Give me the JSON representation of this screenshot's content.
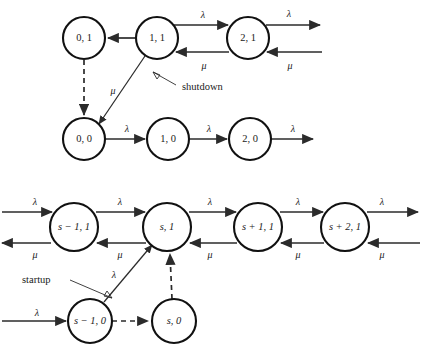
{
  "figure": {
    "type": "state-transition-diagram",
    "title": "",
    "background_color": "#ffffff",
    "stroke_color": "#2b2b2b",
    "node_fill": "#ffffff"
  },
  "symbols": {
    "lambda": "λ",
    "mu": "μ",
    "minus": "−",
    "plus": "+"
  },
  "annotations": [
    {
      "id": "shutdown",
      "text": "shutdown"
    },
    {
      "id": "startup",
      "text": "startup"
    }
  ],
  "caption": {
    "text": ""
  },
  "upper_chain": {
    "name": "upper-chain",
    "nodes": [
      {
        "id": "n-0-1",
        "label": "0, 1",
        "italic": false,
        "cx": 84,
        "cy": 38,
        "r": 21
      },
      {
        "id": "n-1-1",
        "label": "1, 1",
        "italic": false,
        "cx": 157,
        "cy": 38,
        "r": 21
      },
      {
        "id": "n-2-1",
        "label": "2, 1",
        "italic": false,
        "cx": 248,
        "cy": 38,
        "r": 21
      },
      {
        "id": "n-0-0",
        "label": "0, 0",
        "italic": false,
        "cx": 84,
        "cy": 139,
        "r": 21
      },
      {
        "id": "n-1-0",
        "label": "1, 0",
        "italic": false,
        "cx": 168,
        "cy": 139,
        "r": 21
      },
      {
        "id": "n-2-0",
        "label": "2, 0",
        "italic": false,
        "cx": 250,
        "cy": 139,
        "r": 21
      }
    ],
    "edges": [
      {
        "id": "e-11-to-01",
        "from": "n-1-1",
        "to": "n-0-1",
        "rate": "μ",
        "style": "solid",
        "rate_shown": false
      },
      {
        "id": "e-11-to-21",
        "from": "n-1-1",
        "to": "n-2-1",
        "rate": "λ",
        "style": "solid",
        "rate_shown": true
      },
      {
        "id": "e-21-to-11",
        "from": "n-2-1",
        "to": "n-1-1",
        "rate": "μ",
        "style": "solid",
        "rate_shown": true
      },
      {
        "id": "e-21-out",
        "from": "n-2-1",
        "to": "offpage",
        "rate": "λ",
        "style": "solid",
        "rate_shown": true
      },
      {
        "id": "e-in-to-21",
        "from": "offpage",
        "to": "n-2-1",
        "rate": "μ",
        "style": "solid",
        "rate_shown": true
      },
      {
        "id": "e-01-to-00",
        "from": "n-0-1",
        "to": "n-0-0",
        "rate": "",
        "style": "dashed",
        "rate_shown": false
      },
      {
        "id": "e-11-to-00",
        "from": "n-1-1",
        "to": "n-0-0",
        "rate": "μ",
        "style": "solid",
        "rate_shown": true
      },
      {
        "id": "e-00-to-10",
        "from": "n-0-0",
        "to": "n-1-0",
        "rate": "λ",
        "style": "solid",
        "rate_shown": true
      },
      {
        "id": "e-10-to-20",
        "from": "n-1-0",
        "to": "n-2-0",
        "rate": "λ",
        "style": "solid",
        "rate_shown": true
      },
      {
        "id": "e-20-out",
        "from": "n-2-0",
        "to": "offpage",
        "rate": "λ",
        "style": "solid",
        "rate_shown": true
      }
    ]
  },
  "lower_chain": {
    "name": "lower-chain",
    "nodes": [
      {
        "id": "n-sm1-1",
        "label": "s − 1, 1",
        "italic": true,
        "cx": 74,
        "cy": 227,
        "r": 24
      },
      {
        "id": "n-s-1",
        "label": "s, 1",
        "italic": true,
        "cx": 167,
        "cy": 227,
        "r": 24
      },
      {
        "id": "n-sp1-1",
        "label": "s + 1, 1",
        "italic": true,
        "cx": 258,
        "cy": 227,
        "r": 24
      },
      {
        "id": "n-sp2-1",
        "label": "s + 2, 1",
        "italic": true,
        "cx": 345,
        "cy": 227,
        "r": 24
      },
      {
        "id": "n-sm1-0",
        "label": "s − 1, 0",
        "italic": true,
        "cx": 90,
        "cy": 321,
        "r": 22
      },
      {
        "id": "n-s-0",
        "label": "s, 0",
        "italic": true,
        "cx": 174,
        "cy": 321,
        "r": 22
      }
    ],
    "edges": [
      {
        "id": "l-in-to-sm11",
        "from": "offpage",
        "to": "n-sm1-1",
        "rate": "λ",
        "style": "solid",
        "rate_shown": true
      },
      {
        "id": "l-sm11-out",
        "from": "n-sm1-1",
        "to": "offpage",
        "rate": "μ",
        "style": "solid",
        "rate_shown": true
      },
      {
        "id": "l-sm11-to-s1",
        "from": "n-sm1-1",
        "to": "n-s-1",
        "rate": "λ",
        "style": "solid",
        "rate_shown": true
      },
      {
        "id": "l-s1-to-sm11",
        "from": "n-s-1",
        "to": "n-sm1-1",
        "rate": "μ",
        "style": "solid",
        "rate_shown": true
      },
      {
        "id": "l-s1-to-sp11",
        "from": "n-s-1",
        "to": "n-sp1-1",
        "rate": "λ",
        "style": "solid",
        "rate_shown": true
      },
      {
        "id": "l-sp11-to-s1",
        "from": "n-sp1-1",
        "to": "n-s-1",
        "rate": "μ",
        "style": "solid",
        "rate_shown": true
      },
      {
        "id": "l-sp11-to-sp21",
        "from": "n-sp1-1",
        "to": "n-sp2-1",
        "rate": "λ",
        "style": "solid",
        "rate_shown": true
      },
      {
        "id": "l-sp21-to-sp11",
        "from": "n-sp2-1",
        "to": "n-sp1-1",
        "rate": "μ",
        "style": "solid",
        "rate_shown": true
      },
      {
        "id": "l-sp21-out",
        "from": "n-sp2-1",
        "to": "offpage",
        "rate": "λ",
        "style": "solid",
        "rate_shown": true
      },
      {
        "id": "l-in-to-sp21",
        "from": "offpage",
        "to": "n-sp2-1",
        "rate": "μ",
        "style": "solid",
        "rate_shown": true
      },
      {
        "id": "l-in-to-sm10",
        "from": "offpage",
        "to": "n-sm1-0",
        "rate": "λ",
        "style": "solid",
        "rate_shown": true
      },
      {
        "id": "l-sm10-to-s1",
        "from": "n-sm1-0",
        "to": "n-s-1",
        "rate": "λ",
        "style": "solid",
        "rate_shown": true
      },
      {
        "id": "l-sm10-to-s0",
        "from": "n-sm1-0",
        "to": "n-s-0",
        "rate": "",
        "style": "dashed",
        "rate_shown": false
      },
      {
        "id": "l-s0-to-s1",
        "from": "n-s-0",
        "to": "n-s-1",
        "rate": "",
        "style": "dashed",
        "rate_shown": false
      }
    ]
  },
  "rate_labels": {
    "upper": [
      {
        "id": "u-lam-1",
        "text": "λ",
        "x": 203,
        "y": 14
      },
      {
        "id": "u-lam-2",
        "text": "λ",
        "x": 289,
        "y": 13
      },
      {
        "id": "u-mu-1",
        "text": "μ",
        "x": 204,
        "y": 66
      },
      {
        "id": "u-mu-2",
        "text": "μ",
        "x": 290,
        "y": 66
      },
      {
        "id": "u-mu-3",
        "text": "μ",
        "x": 113,
        "y": 91
      },
      {
        "id": "u-lam-3",
        "text": "λ",
        "x": 127,
        "y": 129
      },
      {
        "id": "u-lam-4",
        "text": "λ",
        "x": 209,
        "y": 129
      },
      {
        "id": "u-lam-5",
        "text": "λ",
        "x": 293,
        "y": 129
      }
    ],
    "lower": [
      {
        "id": "l-lam-0",
        "text": "λ",
        "x": 35,
        "y": 202
      },
      {
        "id": "l-lam-1",
        "text": "λ",
        "x": 120,
        "y": 202
      },
      {
        "id": "l-lam-2",
        "text": "λ",
        "x": 210,
        "y": 202
      },
      {
        "id": "l-lam-3",
        "text": "λ",
        "x": 298,
        "y": 202
      },
      {
        "id": "l-lam-4",
        "text": "λ",
        "x": 382,
        "y": 202
      },
      {
        "id": "l-mu-0",
        "text": "μ",
        "x": 35,
        "y": 255
      },
      {
        "id": "l-mu-1",
        "text": "μ",
        "x": 120,
        "y": 255
      },
      {
        "id": "l-mu-2",
        "text": "μ",
        "x": 210,
        "y": 255
      },
      {
        "id": "l-mu-3",
        "text": "μ",
        "x": 298,
        "y": 255
      },
      {
        "id": "l-mu-4",
        "text": "μ",
        "x": 382,
        "y": 255
      },
      {
        "id": "l-lam-5",
        "text": "λ",
        "x": 114,
        "y": 275
      },
      {
        "id": "l-lam-6",
        "text": "λ",
        "x": 37,
        "y": 313
      }
    ]
  }
}
